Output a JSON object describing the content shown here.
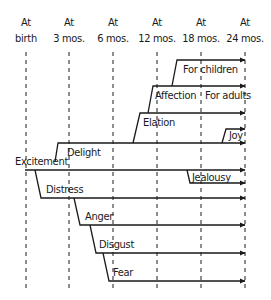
{
  "diagram": {
    "type": "emotional-development-timeline",
    "columns": [
      {
        "line1": "At",
        "line2": "birth",
        "x": 26
      },
      {
        "line1": "At",
        "line2": "3 mos.",
        "x": 69
      },
      {
        "line1": "At",
        "line2": "6 mos.",
        "x": 113
      },
      {
        "line1": "At",
        "line2": "12 mos.",
        "x": 157
      },
      {
        "line1": "At",
        "line2": "18 mos.",
        "x": 201
      },
      {
        "line1": "At",
        "line2": "24 mos.",
        "x": 245
      }
    ],
    "emotions": {
      "excitement": "Excitement",
      "delight": "Delight",
      "elation": "Elation",
      "affection": "Affection",
      "for_children": "For children",
      "for_adults": "For adults",
      "joy": "Joy",
      "distress": "Distress",
      "jealousy": "Jealousy",
      "anger": "Anger",
      "disgust": "Disgust",
      "fear": "Fear"
    },
    "colors": {
      "ink": "#1a1a1a",
      "background": "#ffffff"
    }
  }
}
